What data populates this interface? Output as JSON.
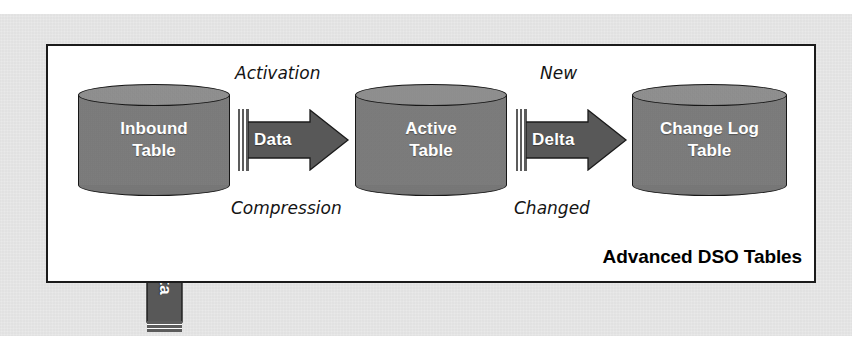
{
  "diagram": {
    "title": "Advanced DSO Tables",
    "frame": {
      "border_color": "#1b1b1b",
      "fill": "#ffffff"
    },
    "page_background": "#e9e9e9",
    "palette": {
      "cylinder_body": "#7b7b7b",
      "cylinder_top": "#8d8d8d",
      "arrow_fill": "#5c5c5c",
      "outline": "#161616",
      "label_text": "#ffffff",
      "caption_text": "#141414"
    },
    "nodes": [
      {
        "id": "inbound-table",
        "label": "Inbound\nTable",
        "shape": "cylinder"
      },
      {
        "id": "active-table",
        "label": "Active\nTable",
        "shape": "cylinder"
      },
      {
        "id": "change-log-table",
        "label": "Change Log\nTable",
        "shape": "cylinder"
      }
    ],
    "flows": [
      {
        "id": "data-flow",
        "label": "Data",
        "direction": "right",
        "caption_above": "Activation",
        "caption_below": "Compression",
        "from": "inbound-table",
        "to": "active-table"
      },
      {
        "id": "delta-flow",
        "label": "Delta",
        "direction": "right",
        "caption_above": "New",
        "caption_below": "Changed",
        "from": "active-table",
        "to": "change-log-table"
      },
      {
        "id": "data-inflow",
        "label": "Data",
        "direction": "up",
        "caption_above": "",
        "caption_below": "",
        "from": "",
        "to": "inbound-table"
      }
    ]
  }
}
